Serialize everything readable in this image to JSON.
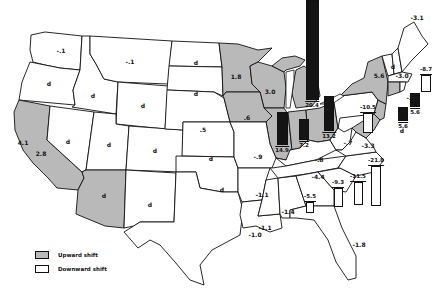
{
  "legend": {
    "items": [
      {
        "label": "Upward shift",
        "fill": "#b9b9b9"
      },
      {
        "label": "Downward shift",
        "fill": "#ffffff"
      }
    ]
  },
  "colors": {
    "upward": "#b9b9b9",
    "downward": "#ffffff",
    "bar_positive": "#141414",
    "border": "#111111"
  },
  "states": {
    "WA": {
      "value": "-.1",
      "shift": "down"
    },
    "MT": {
      "value": "-.1",
      "shift": "down"
    },
    "OR": {
      "value": "d",
      "shift": "down"
    },
    "ID": {
      "value": "d",
      "shift": "down"
    },
    "WY": {
      "value": "d",
      "shift": "down"
    },
    "ND": {
      "value": "d",
      "shift": "down"
    },
    "SD": {
      "value": "d",
      "shift": "down"
    },
    "NE": {
      "value": ".5",
      "shift": "down"
    },
    "NV": {
      "value": "d",
      "shift": "down"
    },
    "UT": {
      "value": "d",
      "shift": "down"
    },
    "CO": {
      "value": "d",
      "shift": "down"
    },
    "KS": {
      "value": "d",
      "shift": "down"
    },
    "NM": {
      "value": "d",
      "shift": "down"
    },
    "OK": {
      "value": "d",
      "shift": "down"
    },
    "CA": {
      "value": "2.8",
      "shift": "up"
    },
    "CA_city": {
      "value": "4.1",
      "shift": "up"
    },
    "AZ": {
      "value": "d",
      "shift": "up"
    },
    "MN": {
      "value": "1.8",
      "shift": "up"
    },
    "WI": {
      "value": "3.0",
      "shift": "up"
    },
    "IA": {
      "value": ".6",
      "shift": "up"
    },
    "MI": {
      "value": "20.4",
      "shift": "up"
    },
    "IL": {
      "value": "14.9",
      "shift": "up"
    },
    "IN": {
      "value": "7.2",
      "shift": "up"
    },
    "OH": {
      "value": "13.2",
      "shift": "up"
    },
    "NY": {
      "value": "5.6",
      "shift": "up"
    },
    "VT": {
      "value": "d",
      "shift": "down"
    },
    "NH": {
      "value": "-3.0",
      "shift": "down"
    },
    "ME": {
      "value": "-3.1",
      "shift": "down"
    },
    "MA": {
      "value": "-8.7",
      "shift": "down"
    },
    "RI": {
      "value": "-3.8",
      "shift": "down"
    },
    "CT": {
      "value": "5.6",
      "shift": "up"
    },
    "NJ": {
      "value": "5.6",
      "shift": "up"
    },
    "DE": {
      "value": "d",
      "shift": "up"
    },
    "PA": {
      "value": "-10.5",
      "shift": "down"
    },
    "WV": {
      "value": "-.7",
      "shift": "down"
    },
    "VA": {
      "value": "-3.3",
      "shift": "down"
    },
    "KY": {
      "value": "-.8",
      "shift": "down"
    },
    "MO": {
      "value": "-.9",
      "shift": "down"
    },
    "TN": {
      "value": "-4.4",
      "shift": "down"
    },
    "NC": {
      "value": "-21.8",
      "shift": "down"
    },
    "SC": {
      "value": "-11.5",
      "shift": "down"
    },
    "GA": {
      "value": "-9.3",
      "shift": "down"
    },
    "AL": {
      "value": "-5.5",
      "shift": "down"
    },
    "MS": {
      "value": "-1.4",
      "shift": "down"
    },
    "AR": {
      "value": "-1.1",
      "shift": "down"
    },
    "LA": {
      "value": "-1.1",
      "shift": "down"
    },
    "TX": {
      "value": "-1.0",
      "shift": "down"
    },
    "FL": {
      "value": "-1.8",
      "shift": "down"
    }
  }
}
